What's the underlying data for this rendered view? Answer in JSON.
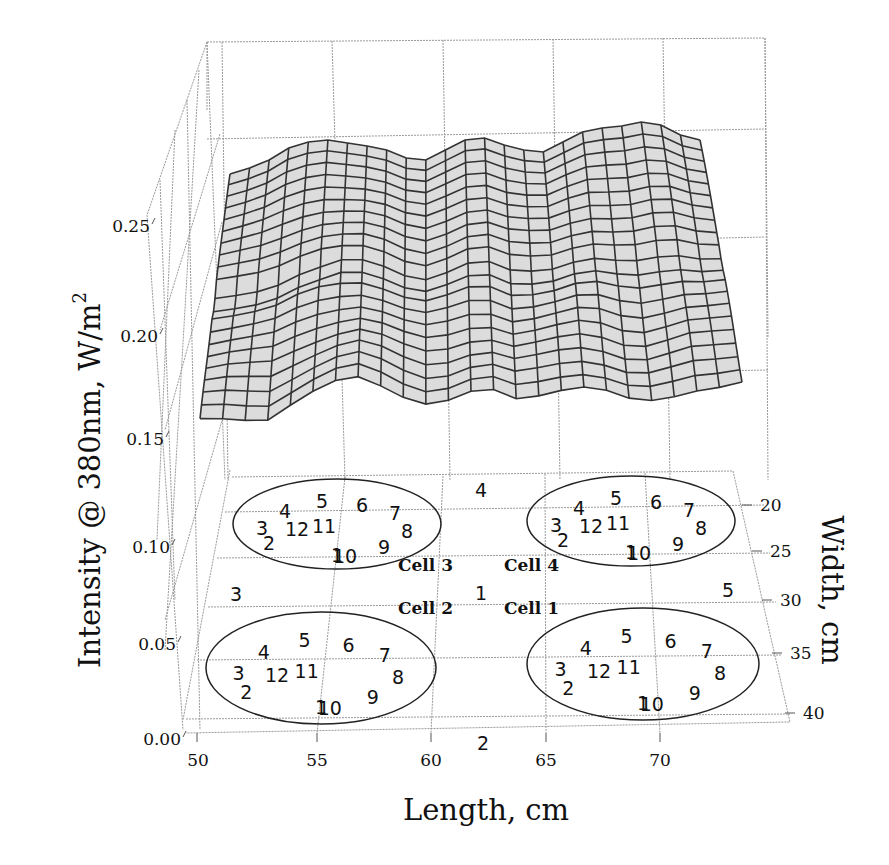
{
  "chart_data": {
    "type": "surface3d",
    "title": "",
    "xlabel": "Length, cm",
    "ylabel": "Width, cm",
    "zlabel": "Intensity @ 380nm, W/m",
    "zlabel_sup": "2",
    "x_ticks": [
      "50",
      "55",
      "60",
      "65",
      "70"
    ],
    "y_ticks": [
      "20",
      "25",
      "30",
      "35",
      "40"
    ],
    "z_ticks": [
      "0.00",
      "0.05",
      "0.10",
      "0.15",
      "0.20",
      "0.25"
    ],
    "xlim": [
      50,
      74
    ],
    "ylim": [
      20,
      40
    ],
    "zlim": [
      0.0,
      0.28
    ],
    "grid": true,
    "surface_description": "Gray wireframe mesh, intensity approximately 0.15–0.27 W/m², higher toward width 20 cm and lower toward width 40 cm, with undulations along length.",
    "surface_front_edge_z_estimates": {
      "x": [
        50,
        52,
        54,
        56,
        58,
        60,
        62,
        64,
        66,
        68,
        70,
        72,
        74
      ],
      "z": [
        0.16,
        0.165,
        0.17,
        0.18,
        0.175,
        0.17,
        0.18,
        0.175,
        0.185,
        0.175,
        0.17,
        0.18,
        0.185
      ]
    },
    "surface_back_edge_z_estimates": {
      "x": [
        50,
        52,
        54,
        56,
        58,
        60,
        62,
        64,
        66,
        68,
        70,
        72,
        74
      ],
      "z": [
        0.245,
        0.255,
        0.255,
        0.25,
        0.26,
        0.265,
        0.262,
        0.258,
        0.268,
        0.272,
        0.275,
        0.27,
        0.265
      ]
    },
    "floor_annotations": {
      "cells": [
        {
          "name": "Cell 3",
          "points": [
            "1",
            "2",
            "3",
            "4",
            "5",
            "6",
            "7",
            "8",
            "9",
            "10",
            "11",
            "12"
          ]
        },
        {
          "name": "Cell 4",
          "points": [
            "1",
            "2",
            "3",
            "4",
            "5",
            "6",
            "7",
            "8",
            "9",
            "10",
            "11",
            "12"
          ]
        },
        {
          "name": "Cell 2",
          "points": [
            "1",
            "2",
            "3",
            "4",
            "5",
            "6",
            "7",
            "8",
            "9",
            "10",
            "11",
            "12"
          ]
        },
        {
          "name": "Cell 1",
          "points": [
            "1",
            "2",
            "3",
            "4",
            "5",
            "6",
            "7",
            "8",
            "9",
            "10",
            "11",
            "12"
          ]
        }
      ],
      "center_points": [
        "1",
        "2",
        "3",
        "4",
        "5"
      ]
    }
  },
  "labels": {
    "cell3": "Cell 3",
    "cell4": "Cell 4",
    "cell2": "Cell 2",
    "cell1": "Cell 1"
  }
}
